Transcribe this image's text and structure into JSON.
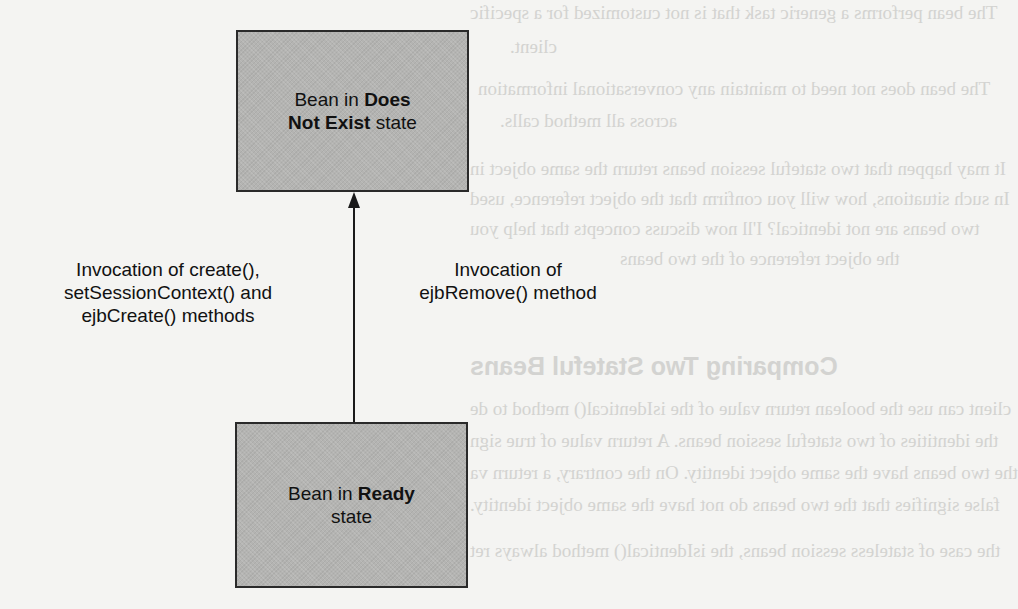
{
  "diagram": {
    "type": "state-transition",
    "states": [
      {
        "id": "does-not-exist",
        "prefix": "Bean in ",
        "bold": "Does Not Exist",
        "suffix": " state",
        "line1_prefix": "Bean in ",
        "line1_bold": "Does",
        "line2_bold": "Not Exist",
        "line2_suffix": " state"
      },
      {
        "id": "ready",
        "prefix": "Bean in ",
        "bold": "Ready",
        "suffix": " state",
        "line1_prefix": "Bean in ",
        "line1_bold": "Ready",
        "line2_suffix": "state"
      }
    ],
    "transitions": [
      {
        "from": "ready",
        "to": "does-not-exist",
        "direction": "up"
      }
    ],
    "labels": {
      "left": [
        "Invocation of create(),",
        "setSessionContext() and",
        "ejbCreate() methods"
      ],
      "right": [
        "Invocation of",
        "ejbRemove() method"
      ]
    },
    "colors": {
      "box_fill": "#b4b4b2",
      "box_border": "#2a2a2a",
      "arrow": "#1a1a1a",
      "background": "#f4f4f2"
    }
  },
  "background_bleed": {
    "lines": [
      "The bean performs a generic task that is not customized for a specific",
      "client.",
      "The bean does not need to maintain any conversational information",
      "across all method calls.",
      "It may happen that two stateful session beans return the same object in",
      "In such situations, how will you confirm that the object reference, used",
      "two beans are not identical? I'll now discuss concepts that help you",
      "the object reference of the two beans",
      "Comparing Two Stateful Beans",
      "client can use the boolean return value of the isIdentical() method to de",
      "the identities of two stateful session beans. A return value of true sign",
      "the two beans have the same object identity. On the contrary, a return va",
      "false signifies that the two beans do not have the same object identity.",
      "the case of stateless session beans, the isIdentical() method always ret"
    ]
  }
}
